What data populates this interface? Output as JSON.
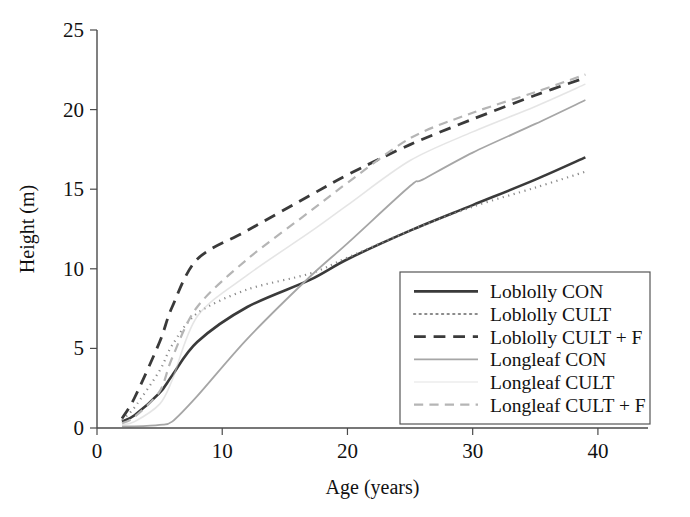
{
  "chart_data": {
    "type": "line",
    "title": "",
    "xlabel": "Age (years)",
    "ylabel": "Height (m)",
    "xlim": [
      0,
      44
    ],
    "ylim": [
      0,
      25
    ],
    "xticks": [
      0,
      10,
      20,
      30,
      40
    ],
    "yticks": [
      0,
      5,
      10,
      15,
      20,
      25
    ],
    "xticklabels": [
      "0",
      "10",
      "20",
      "30",
      "40"
    ],
    "yticklabels": [
      "0",
      "5",
      "10",
      "15",
      "20",
      "25"
    ],
    "grid": false,
    "legend_position": "lower right",
    "series": [
      {
        "name": "Loblolly CON",
        "style": "solid",
        "color": "#3a3a3a",
        "width": 2.6,
        "x": [
          2,
          3,
          5,
          6,
          8,
          12,
          17,
          20,
          25,
          30,
          35,
          39
        ],
        "y": [
          0.4,
          0.8,
          2.2,
          3.3,
          5.4,
          7.6,
          9.3,
          10.6,
          12.4,
          14.0,
          15.6,
          17.0
        ]
      },
      {
        "name": "Loblolly CULT",
        "style": "dotted",
        "color": "#8a8a8a",
        "width": 2.2,
        "x": [
          2,
          3,
          5,
          6,
          8,
          12,
          17,
          20,
          25,
          30,
          35,
          39
        ],
        "y": [
          0.5,
          1.3,
          3.6,
          5.2,
          7.2,
          8.7,
          9.7,
          10.7,
          12.4,
          13.9,
          15.1,
          16.1
        ]
      },
      {
        "name": "Loblolly CULT + F",
        "style": "dashed",
        "color": "#3a3a3a",
        "width": 2.8,
        "x": [
          2,
          3,
          5,
          6,
          8,
          12,
          17,
          20,
          25,
          30,
          35,
          39
        ],
        "y": [
          0.6,
          1.9,
          5.4,
          7.6,
          10.6,
          12.4,
          14.6,
          15.9,
          17.8,
          19.4,
          20.9,
          22.0
        ]
      },
      {
        "name": "Longleaf CON",
        "style": "solid",
        "color": "#a6a6a6",
        "width": 1.8,
        "x": [
          2,
          3,
          5,
          6,
          8,
          12,
          17,
          20,
          25,
          26,
          30,
          35,
          39
        ],
        "y": [
          0.1,
          0.1,
          0.2,
          0.4,
          2.0,
          5.6,
          9.5,
          11.6,
          15.2,
          15.6,
          17.3,
          19.1,
          20.6
        ]
      },
      {
        "name": "Longleaf CULT",
        "style": "faint",
        "color": "#cfcfcf",
        "width": 1.6,
        "x": [
          2,
          3,
          5,
          6,
          8,
          12,
          17,
          20,
          25,
          30,
          35,
          39
        ],
        "y": [
          0.2,
          0.4,
          1.5,
          3.0,
          7.0,
          9.6,
          12.3,
          14.0,
          16.8,
          18.6,
          20.2,
          21.6
        ]
      },
      {
        "name": "Longleaf CULT + F",
        "style": "dashed",
        "color": "#b5b5b5",
        "width": 2.2,
        "x": [
          2,
          3,
          5,
          6,
          8,
          12,
          17,
          20,
          25,
          30,
          35,
          39
        ],
        "y": [
          0.3,
          0.7,
          2.3,
          4.4,
          7.6,
          10.6,
          13.6,
          15.4,
          18.2,
          19.8,
          21.1,
          22.2
        ]
      }
    ]
  },
  "legend": {
    "items": [
      {
        "label": "Loblolly CON"
      },
      {
        "label": "Loblolly CULT"
      },
      {
        "label": "Loblolly CULT + F"
      },
      {
        "label": "Longleaf CON"
      },
      {
        "label": "Longleaf CULT"
      },
      {
        "label": "Longleaf CULT + F"
      }
    ]
  }
}
